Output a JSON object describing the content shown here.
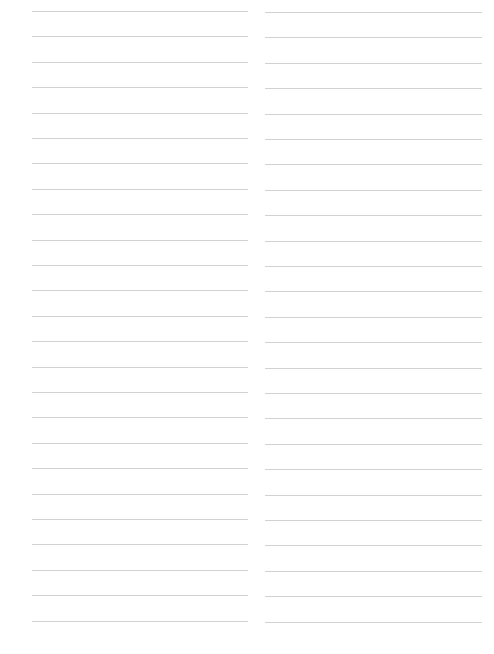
{
  "page": {
    "type": "ruled-paper",
    "columns": 2,
    "lines_per_column": 25,
    "line_color": "#d2d2d2",
    "background_color": "#ffffff",
    "first_line_y": 11,
    "line_spacing": 25.4,
    "left_column": {
      "x_start": 32,
      "x_end": 248
    },
    "right_column": {
      "x_start": 265,
      "x_end": 482
    },
    "text": []
  }
}
